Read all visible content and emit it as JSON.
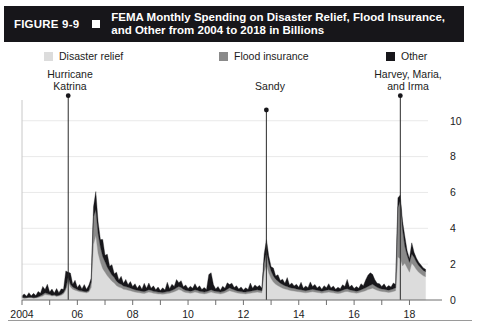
{
  "figure": {
    "number": "FIGURE 9-9",
    "title_line1": "FEMA Monthly Spending on Disaster Relief, Flood Insurance,",
    "title_line2": "and Other from 2004 to 2018 in Billions",
    "bar_color": "#17161a",
    "bar_text_color": "#ffffff"
  },
  "legend": {
    "items": [
      {
        "label": "Disaster relief",
        "color": "#dcdcdc"
      },
      {
        "label": "Flood insurance",
        "color": "#8a8a8a"
      },
      {
        "label": "Other",
        "color": "#17161a"
      }
    ]
  },
  "annotations": [
    {
      "id": "katrina",
      "line1": "Hurricane",
      "line2": "Katrina",
      "x_value": 2005.67,
      "y_top": 11.4
    },
    {
      "id": "sandy",
      "line1": "Sandy",
      "line2": "",
      "x_value": 2012.83,
      "y_top": 10.6
    },
    {
      "id": "hmi",
      "line1": "Harvey, Maria,",
      "line2": "and Irma",
      "x_value": 2017.67,
      "y_top": 11.4
    }
  ],
  "chart_data": {
    "type": "area",
    "stacked": true,
    "title": "FEMA Monthly Spending on Disaster Relief, Flood Insurance, and Other from 2004 to 2018 in Billions",
    "xlabel": "",
    "ylabel": "",
    "ylim": [
      0,
      10.6
    ],
    "xlim": [
      2004.0,
      2018.67
    ],
    "yticks": [
      0,
      2,
      4,
      6,
      8,
      10
    ],
    "ytick_labels": [
      "0",
      "2",
      "4",
      "6",
      "8",
      "10"
    ],
    "xticks": [
      2004,
      2005,
      2006,
      2007,
      2008,
      2009,
      2010,
      2011,
      2012,
      2013,
      2014,
      2015,
      2016,
      2017,
      2018
    ],
    "xtick_labels": [
      "2004",
      "",
      "06",
      "",
      "08",
      "",
      "10",
      "",
      "12",
      "",
      "14",
      "",
      "16",
      "",
      "18"
    ],
    "grid": "horizontal",
    "legend_position": "top",
    "units": "Billions of dollars per month",
    "series": [
      {
        "name": "Disaster relief",
        "color": "#dcdcdc",
        "values": [
          0.12,
          0.1,
          0.11,
          0.13,
          0.12,
          0.1,
          0.11,
          0.14,
          0.18,
          0.22,
          0.3,
          0.28,
          0.26,
          0.22,
          0.24,
          0.2,
          0.22,
          0.26,
          0.34,
          0.55,
          1.05,
          0.72,
          0.6,
          0.55,
          0.5,
          0.46,
          0.44,
          0.42,
          0.4,
          0.45,
          0.7,
          3.1,
          3.6,
          2.6,
          2.1,
          1.75,
          1.55,
          1.35,
          1.2,
          1.05,
          0.95,
          0.8,
          0.72,
          0.68,
          0.6,
          0.58,
          0.55,
          0.52,
          0.48,
          0.44,
          0.42,
          0.4,
          0.38,
          0.36,
          0.4,
          0.44,
          0.42,
          0.38,
          0.36,
          0.34,
          0.33,
          0.32,
          0.34,
          0.36,
          0.38,
          0.42,
          0.46,
          0.52,
          0.58,
          0.54,
          0.46,
          0.42,
          0.4,
          0.38,
          0.4,
          0.44,
          0.42,
          0.38,
          0.36,
          0.34,
          0.36,
          0.4,
          0.44,
          0.4,
          0.38,
          0.36,
          0.34,
          0.36,
          0.4,
          0.46,
          0.52,
          0.48,
          0.44,
          0.4,
          0.38,
          0.36,
          0.35,
          0.34,
          0.36,
          0.38,
          0.4,
          0.42,
          0.44,
          0.42,
          0.4,
          1.55,
          1.95,
          1.5,
          1.2,
          1.0,
          0.88,
          0.8,
          0.72,
          0.66,
          0.62,
          0.58,
          0.54,
          0.52,
          0.5,
          0.48,
          0.46,
          0.44,
          0.42,
          0.4,
          0.42,
          0.44,
          0.46,
          0.44,
          0.42,
          0.4,
          0.38,
          0.4,
          0.42,
          0.44,
          0.42,
          0.4,
          0.38,
          0.36,
          0.38,
          0.42,
          0.46,
          0.48,
          0.44,
          0.42,
          0.4,
          0.38,
          0.4,
          0.44,
          0.48,
          0.52,
          0.58,
          0.62,
          0.66,
          0.6,
          0.54,
          0.5,
          0.48,
          0.46,
          0.44,
          0.42,
          0.44,
          0.48,
          0.52,
          2.4,
          2.3,
          1.9,
          2.05,
          1.8,
          1.55,
          2.05,
          1.9,
          1.7,
          1.55,
          1.45,
          1.35,
          1.3
        ]
      },
      {
        "name": "Flood insurance",
        "color": "#8a8a8a",
        "values": [
          0.02,
          0.02,
          0.02,
          0.02,
          0.03,
          0.03,
          0.03,
          0.04,
          0.06,
          0.08,
          0.1,
          0.08,
          0.06,
          0.05,
          0.05,
          0.04,
          0.05,
          0.06,
          0.08,
          0.12,
          0.22,
          0.16,
          0.12,
          0.1,
          0.08,
          0.07,
          0.07,
          0.06,
          0.06,
          0.08,
          0.3,
          1.55,
          1.45,
          1.1,
          0.85,
          0.68,
          0.58,
          0.48,
          0.4,
          0.34,
          0.3,
          0.25,
          0.22,
          0.2,
          0.18,
          0.17,
          0.16,
          0.15,
          0.14,
          0.13,
          0.12,
          0.12,
          0.11,
          0.11,
          0.12,
          0.13,
          0.12,
          0.11,
          0.11,
          0.1,
          0.1,
          0.1,
          0.1,
          0.11,
          0.11,
          0.12,
          0.14,
          0.16,
          0.18,
          0.16,
          0.14,
          0.12,
          0.12,
          0.11,
          0.12,
          0.13,
          0.12,
          0.11,
          0.11,
          0.1,
          0.11,
          0.12,
          0.13,
          0.12,
          0.11,
          0.11,
          0.1,
          0.11,
          0.12,
          0.14,
          0.16,
          0.14,
          0.13,
          0.12,
          0.11,
          0.11,
          0.1,
          0.1,
          0.11,
          0.11,
          0.12,
          0.12,
          0.13,
          0.12,
          0.12,
          0.5,
          0.72,
          0.55,
          0.42,
          0.34,
          0.28,
          0.25,
          0.22,
          0.2,
          0.18,
          0.17,
          0.16,
          0.15,
          0.15,
          0.14,
          0.13,
          0.13,
          0.12,
          0.12,
          0.13,
          0.13,
          0.14,
          0.13,
          0.12,
          0.12,
          0.11,
          0.12,
          0.13,
          0.13,
          0.12,
          0.12,
          0.11,
          0.11,
          0.12,
          0.13,
          0.14,
          0.15,
          0.13,
          0.13,
          0.12,
          0.11,
          0.12,
          0.13,
          0.15,
          0.16,
          0.18,
          0.2,
          0.22,
          0.19,
          0.17,
          0.15,
          0.14,
          0.14,
          0.13,
          0.13,
          0.14,
          0.15,
          0.16,
          2.75,
          3.25,
          2.05,
          0.95,
          0.7,
          0.55,
          0.52,
          0.48,
          0.42,
          0.38,
          0.34,
          0.3,
          0.28
        ]
      },
      {
        "name": "Other",
        "color": "#17161a",
        "values": [
          0.1,
          0.22,
          0.08,
          0.26,
          0.09,
          0.24,
          0.11,
          0.3,
          0.14,
          0.46,
          0.18,
          0.52,
          0.12,
          0.34,
          0.1,
          0.4,
          0.14,
          0.3,
          0.18,
          0.95,
          0.28,
          0.62,
          0.16,
          0.45,
          0.12,
          0.34,
          0.1,
          0.38,
          0.14,
          0.3,
          0.22,
          0.55,
          1.0,
          0.65,
          0.42,
          0.95,
          0.36,
          0.72,
          0.28,
          0.58,
          0.22,
          0.5,
          0.18,
          0.44,
          0.16,
          0.4,
          0.14,
          0.36,
          0.13,
          0.34,
          0.12,
          0.32,
          0.11,
          0.46,
          0.14,
          0.38,
          0.12,
          0.3,
          0.1,
          0.28,
          0.1,
          0.26,
          0.12,
          0.52,
          0.14,
          0.34,
          0.16,
          0.46,
          0.2,
          0.38,
          0.14,
          0.3,
          0.12,
          0.28,
          0.14,
          0.34,
          0.13,
          0.3,
          0.11,
          0.26,
          0.12,
          0.9,
          0.95,
          0.34,
          0.12,
          0.28,
          0.11,
          0.3,
          0.14,
          0.36,
          0.18,
          0.32,
          0.13,
          0.28,
          0.12,
          0.26,
          0.11,
          0.24,
          0.12,
          0.46,
          0.14,
          0.3,
          0.16,
          0.28,
          0.13,
          0.52,
          0.7,
          0.4,
          0.24,
          0.44,
          0.18,
          0.36,
          0.15,
          0.3,
          0.13,
          0.5,
          0.14,
          0.28,
          0.13,
          0.26,
          0.12,
          0.42,
          0.12,
          0.26,
          0.14,
          0.44,
          0.16,
          0.3,
          0.13,
          0.26,
          0.11,
          0.28,
          0.14,
          0.34,
          0.13,
          0.26,
          0.11,
          0.24,
          0.13,
          0.3,
          0.16,
          0.52,
          0.15,
          0.28,
          0.12,
          0.26,
          0.13,
          0.34,
          0.17,
          0.44,
          0.62,
          0.7,
          0.55,
          0.34,
          0.22,
          0.26,
          0.14,
          0.3,
          0.13,
          0.26,
          0.14,
          0.32,
          0.18,
          0.55,
          0.3,
          0.45,
          0.55,
          0.25,
          0.2,
          0.62,
          0.28,
          0.22,
          0.18,
          0.16,
          0.14,
          0.13
        ]
      }
    ]
  }
}
